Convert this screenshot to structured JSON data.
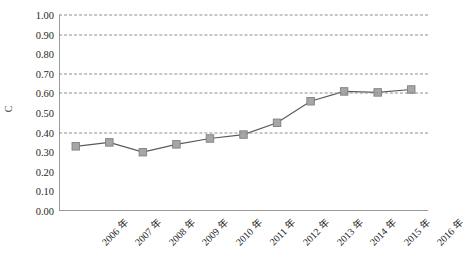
{
  "chart_data": {
    "type": "line",
    "title": "",
    "xlabel": "",
    "ylabel": "C",
    "categories": [
      "2006 年",
      "2007 年",
      "2008 年",
      "2009 年",
      "2010 年",
      "2011 年",
      "2012 年",
      "2013 年",
      "2014 年",
      "2015 年",
      "2016 年"
    ],
    "values": [
      0.33,
      0.35,
      0.3,
      0.34,
      0.37,
      0.39,
      0.45,
      0.56,
      0.61,
      0.605,
      0.62
    ],
    "series": [
      {
        "name": "C",
        "values": [
          0.33,
          0.35,
          0.3,
          0.34,
          0.37,
          0.39,
          0.45,
          0.56,
          0.61,
          0.605,
          0.62
        ]
      }
    ],
    "ylim": [
      0.0,
      1.0
    ],
    "ytick_step": 0.1,
    "ytick_labels": [
      "0.00",
      "0.10",
      "0.20",
      "0.30",
      "0.40",
      "0.50",
      "0.60",
      "0.70",
      "0.80",
      "0.90",
      "1.00"
    ],
    "ytick_values": [
      0.0,
      0.1,
      0.2,
      0.3,
      0.4,
      0.5,
      0.6,
      0.7,
      0.8,
      0.9,
      1.0
    ],
    "gridline_values": [
      0.4,
      0.6,
      0.7,
      0.9,
      1.0
    ],
    "grid": true,
    "legend": "none",
    "marker": "square",
    "colors": {
      "line": "#595959",
      "marker_fill": "#a6a6a6",
      "marker_edge": "#808080",
      "grid": "#8e8e8e",
      "axis": "#9a9a9a",
      "text": "#1f1f1f"
    }
  }
}
